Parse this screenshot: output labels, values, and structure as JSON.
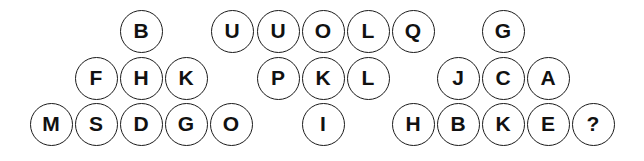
{
  "puzzle": {
    "groups": [
      {
        "name": "left-triangle",
        "cells": [
          {
            "letter": "B",
            "x": 141,
            "y": 31
          },
          {
            "letter": "F",
            "x": 96,
            "y": 78
          },
          {
            "letter": "H",
            "x": 141,
            "y": 78
          },
          {
            "letter": "K",
            "x": 186,
            "y": 78
          },
          {
            "letter": "M",
            "x": 51,
            "y": 124
          },
          {
            "letter": "S",
            "x": 96,
            "y": 124
          },
          {
            "letter": "D",
            "x": 141,
            "y": 124
          },
          {
            "letter": "G",
            "x": 186,
            "y": 124
          },
          {
            "letter": "O",
            "x": 231,
            "y": 124
          }
        ]
      },
      {
        "name": "middle-inverted-triangle",
        "cells": [
          {
            "letter": "U",
            "x": 232,
            "y": 31
          },
          {
            "letter": "U",
            "x": 278,
            "y": 31
          },
          {
            "letter": "O",
            "x": 323,
            "y": 31
          },
          {
            "letter": "L",
            "x": 368,
            "y": 31
          },
          {
            "letter": "Q",
            "x": 413,
            "y": 31
          },
          {
            "letter": "P",
            "x": 278,
            "y": 78
          },
          {
            "letter": "K",
            "x": 323,
            "y": 78
          },
          {
            "letter": "L",
            "x": 368,
            "y": 78
          },
          {
            "letter": "I",
            "x": 323,
            "y": 124
          }
        ]
      },
      {
        "name": "right-triangle",
        "cells": [
          {
            "letter": "G",
            "x": 503,
            "y": 31
          },
          {
            "letter": "J",
            "x": 458,
            "y": 78
          },
          {
            "letter": "C",
            "x": 503,
            "y": 78
          },
          {
            "letter": "A",
            "x": 548,
            "y": 78
          },
          {
            "letter": "H",
            "x": 413,
            "y": 124
          },
          {
            "letter": "B",
            "x": 458,
            "y": 124
          },
          {
            "letter": "K",
            "x": 503,
            "y": 124
          },
          {
            "letter": "E",
            "x": 548,
            "y": 124
          },
          {
            "letter": "?",
            "x": 593,
            "y": 124
          }
        ]
      }
    ]
  }
}
